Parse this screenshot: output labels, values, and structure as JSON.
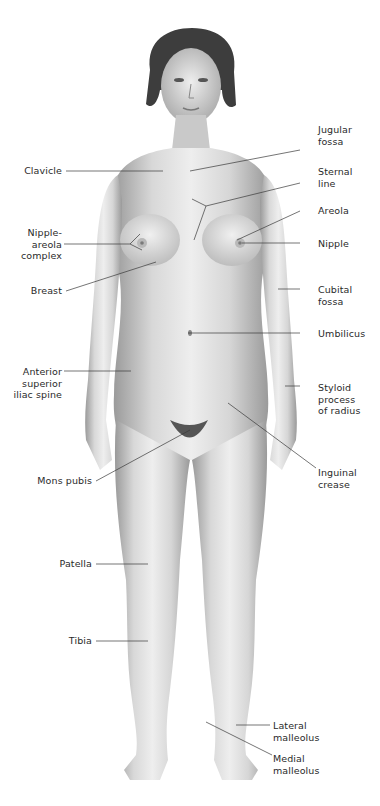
{
  "figure": {
    "line_color": "#3a3a3a",
    "skin_light": "#efefef",
    "skin_mid": "#cfcfcf",
    "skin_dark": "#8a8a8a",
    "hair_color": "#3b3b3b"
  },
  "labels": {
    "left": [
      {
        "id": "clavicle",
        "text": "Clavicle"
      },
      {
        "id": "nipple_areola_complex",
        "text": "Nipple-\nareola\ncomplex"
      },
      {
        "id": "breast",
        "text": "Breast"
      },
      {
        "id": "asis",
        "text": "Anterior\nsuperior\niliac spine"
      },
      {
        "id": "mons_pubis",
        "text": "Mons pubis"
      },
      {
        "id": "patella",
        "text": "Patella"
      },
      {
        "id": "tibia",
        "text": "Tibia"
      }
    ],
    "right": [
      {
        "id": "jugular_fossa",
        "text": "Jugular\nfossa"
      },
      {
        "id": "sternal_line",
        "text": "Sternal\nline"
      },
      {
        "id": "areola",
        "text": "Areola"
      },
      {
        "id": "nipple",
        "text": "Nipple"
      },
      {
        "id": "cubital_fossa",
        "text": "Cubital\nfossa"
      },
      {
        "id": "umbilicus",
        "text": "Umbilicus"
      },
      {
        "id": "styloid_process",
        "text": "Styloid\nprocess\nof radius"
      },
      {
        "id": "inguinal_crease",
        "text": "Inguinal\ncrease"
      },
      {
        "id": "lateral_malleolus",
        "text": "Lateral\nmalleolus"
      },
      {
        "id": "medial_malleolus",
        "text": "Medial\nmalleolus"
      }
    ]
  }
}
